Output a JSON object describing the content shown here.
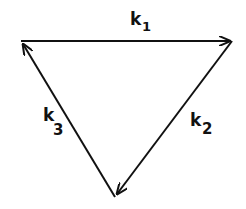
{
  "diagram": {
    "type": "cyclic-reaction-triangle",
    "nodes": [
      {
        "id": "top-left",
        "x": 21,
        "y": 41
      },
      {
        "id": "top-right",
        "x": 232,
        "y": 41
      },
      {
        "id": "bottom",
        "x": 115,
        "y": 197
      }
    ],
    "edges": [
      {
        "from": "top-left",
        "to": "top-right",
        "label": "k",
        "subscript": "1"
      },
      {
        "from": "top-right",
        "to": "bottom",
        "label": "k",
        "subscript": "2"
      },
      {
        "from": "bottom",
        "to": "top-left",
        "label": "k",
        "subscript": "3"
      }
    ],
    "colors": {
      "stroke": "#111111",
      "background": "#ffffff"
    }
  }
}
